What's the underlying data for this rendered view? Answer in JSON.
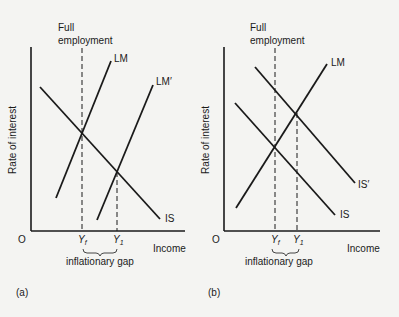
{
  "panels": [
    {
      "id": "a",
      "label": "(a)",
      "ylabel": "Rate of interest",
      "xlabel": "Income",
      "origin": "O",
      "full_employment_line1": "Full",
      "full_employment_line2": "employment",
      "curves": {
        "lm": "LM",
        "lm2": "LM′",
        "is": "IS"
      },
      "ticks": {
        "yf": "Y",
        "yf_sub": "f",
        "y1": "Y",
        "y1_sub": "1"
      },
      "gap_label": "inflationary gap"
    },
    {
      "id": "b",
      "label": "(b)",
      "ylabel": "Rate of interest",
      "xlabel": "Income",
      "origin": "O",
      "full_employment_line1": "Full",
      "full_employment_line2": "employment",
      "curves": {
        "lm": "LM",
        "is": "IS",
        "is2": "IS′"
      },
      "ticks": {
        "yf": "Y",
        "yf_sub": "f",
        "y1": "Y",
        "y1_sub": "1"
      },
      "gap_label": "inflationary gap"
    }
  ]
}
